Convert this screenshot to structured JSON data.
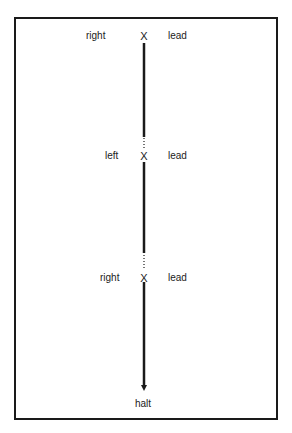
{
  "diagram": {
    "nodes": [
      {
        "marker": "X",
        "left_label": "right",
        "right_label": "lead"
      },
      {
        "marker": "X",
        "left_label": "left",
        "right_label": "lead"
      },
      {
        "marker": "X",
        "left_label": "right",
        "right_label": "lead"
      }
    ],
    "end_label": "halt",
    "colors": {
      "line": "#1a1a1a",
      "text": "#222222",
      "frame": "#1a1a1a"
    }
  }
}
